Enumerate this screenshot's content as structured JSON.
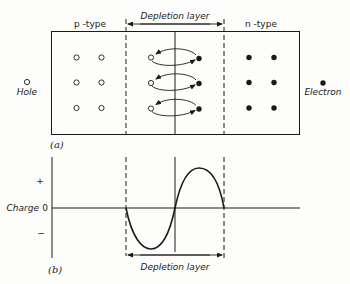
{
  "figure_a": {
    "caption": "(a)",
    "p_region_label": "p -type",
    "n_region_label": "n -type",
    "depletion_label": "Depletion layer",
    "legend_hole_label": "Hole",
    "legend_electron_label": "Electron",
    "hole_grid": {
      "rows": 3,
      "cols": 2
    },
    "electron_grid": {
      "rows": 3,
      "cols": 2
    },
    "carrier_pairs_in_depletion": 3
  },
  "figure_b": {
    "caption": "(b)",
    "y_axis_label": "Charge",
    "tick_plus": "+",
    "tick_zero": "0",
    "tick_minus": "−",
    "depletion_label": "Depletion layer"
  },
  "colors": {
    "line": "#1a1a1a",
    "background": "#fdfdfb"
  }
}
